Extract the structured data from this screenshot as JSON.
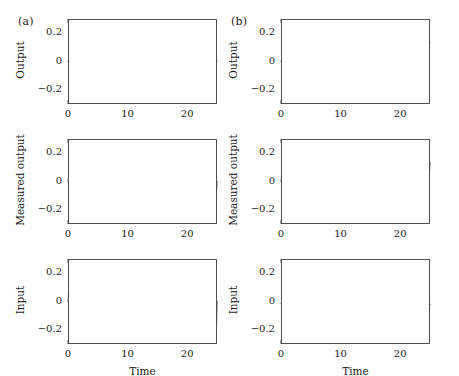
{
  "figure": {
    "background_color": "#ffffff",
    "line_color": "#111111",
    "axis_color": "#4d4d4d",
    "panel_labels": {
      "a": "(a)",
      "b": "(b)"
    }
  },
  "axes": {
    "xlabel": "Time",
    "xticks": [
      0,
      10,
      20
    ],
    "xtick_labels": [
      "0",
      "10",
      "20"
    ],
    "xlim": [
      0,
      25
    ],
    "yticks": [
      -0.2,
      0,
      0.2
    ],
    "ytick_labels": [
      "−0.2",
      "0",
      "0.2"
    ],
    "ylim": [
      -0.3,
      0.3
    ],
    "ylabels": {
      "output": "Output",
      "measured_output": "Measured output",
      "input": "Input"
    }
  },
  "chart_data": {
    "type": "line",
    "title": "",
    "layout": "2 columns (a, b) × 3 rows (Output, Measured output, Input)",
    "shared_x": {
      "label": "Time",
      "range": [
        0,
        25
      ],
      "ticks": [
        0,
        10,
        20
      ]
    },
    "shared_y": {
      "range": [
        -0.3,
        0.3
      ],
      "ticks": [
        -0.2,
        0,
        0.2
      ]
    },
    "grid": false,
    "legend": "none",
    "panels": [
      {
        "panel": "a",
        "row": 1,
        "ylabel": "Output",
        "description": "Near-zero flat response with tiny residual ripple; settles to ~0 after a small initial transient.",
        "model": {
          "kind": "damped_ripple",
          "carrier_amplitude": 0.0,
          "ripple_amplitude": 0.004,
          "ripple_frequency_cycles_per_unit": 2.0,
          "offset": 0.002
        },
        "approx_values": {
          "x": [
            0,
            1,
            2,
            3,
            5,
            8,
            10,
            13,
            15,
            18,
            20,
            23,
            25
          ],
          "y": [
            0.0,
            0.004,
            0.004,
            0.004,
            0.004,
            0.004,
            0.004,
            0.004,
            0.004,
            0.004,
            0.004,
            0.004,
            0.004
          ]
        }
      },
      {
        "panel": "a",
        "row": 2,
        "ylabel": "Measured output",
        "description": "Dense high-frequency oscillation of constant envelope about zero, amplitude about 0.10.",
        "model": {
          "kind": "high_frequency_band",
          "carrier_amplitude": 0.0,
          "ripple_amplitude": 0.1,
          "ripple_frequency_cycles_per_unit": 2.0,
          "offset": 0.0
        },
        "approx_values": {
          "envelope_upper": 0.1,
          "envelope_lower": -0.1
        }
      },
      {
        "panel": "a",
        "row": 3,
        "ylabel": "Input",
        "description": "Dense high-frequency oscillation of constant envelope about zero, amplitude about 0.21.",
        "model": {
          "kind": "high_frequency_band",
          "carrier_amplitude": 0.0,
          "ripple_amplitude": 0.21,
          "ripple_frequency_cycles_per_unit": 2.0,
          "offset": 0.0
        },
        "approx_values": {
          "envelope_upper": 0.21,
          "envelope_lower": -0.21
        }
      },
      {
        "panel": "b",
        "row": 1,
        "ylabel": "Output",
        "description": "Smooth sinusoid, amplitude about 0.16, period about 10.7 time units, starting at zero.",
        "model": {
          "kind": "sinusoid",
          "carrier_amplitude": 0.16,
          "carrier_period": 10.7,
          "carrier_phase": 0.0,
          "ripple_amplitude": 0.0,
          "offset": 0.0
        },
        "approx_values": {
          "x": [
            0,
            2,
            3.8,
            6,
            9,
            11,
            14.4,
            17,
            20,
            22,
            25
          ],
          "y": [
            0.0,
            0.11,
            0.14,
            0.04,
            -0.16,
            -0.12,
            0.15,
            0.06,
            -0.16,
            -0.09,
            0.14
          ]
        }
      },
      {
        "panel": "b",
        "row": 2,
        "ylabel": "Measured output",
        "description": "The panel (b) output sinusoid plus a dense high-frequency ripple of about 0.08 amplitude.",
        "model": {
          "kind": "sinusoid_plus_ripple",
          "carrier_amplitude": 0.16,
          "carrier_period": 10.7,
          "carrier_phase": 0.0,
          "ripple_amplitude": 0.08,
          "ripple_frequency_cycles_per_unit": 2.0,
          "offset": 0.0
        },
        "approx_values": {
          "envelope_upper_peak": 0.24,
          "envelope_lower_peak": -0.24
        }
      },
      {
        "panel": "b",
        "row": 3,
        "ylabel": "Input",
        "description": "Low-amplitude staircase (sample-and-hold) signal, about 0.055 amplitude, period about 11 time units, with a small step transient near t = 0.",
        "model": {
          "kind": "staircase_sinusoid",
          "carrier_amplitude": 0.055,
          "carrier_period": 11.0,
          "carrier_phase": 1.9,
          "sample_hold_step": 0.32,
          "offset": 0.0,
          "initial_spike": 0.055
        },
        "approx_values": {
          "x": [
            0,
            0.7,
            1.5,
            4,
            6,
            9,
            12,
            14.5,
            17,
            20,
            23,
            25
          ],
          "y": [
            -0.01,
            0.05,
            0.03,
            -0.06,
            -0.04,
            0.05,
            0.0,
            -0.05,
            -0.01,
            0.05,
            0.0,
            -0.05
          ]
        }
      }
    ]
  }
}
